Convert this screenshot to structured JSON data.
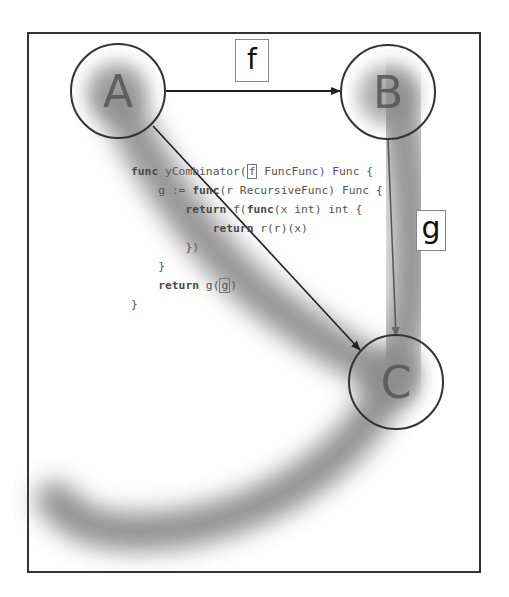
{
  "diagram": {
    "type": "directed-graph",
    "nodes": [
      {
        "id": "A",
        "label": "A"
      },
      {
        "id": "B",
        "label": "B"
      },
      {
        "id": "C",
        "label": "C"
      }
    ],
    "edges": [
      {
        "from": "A",
        "to": "B",
        "label": "f"
      },
      {
        "from": "B",
        "to": "C",
        "label": "g"
      },
      {
        "from": "A",
        "to": "C",
        "label": ""
      }
    ],
    "edge_labels": {
      "f": "f",
      "g": "g"
    },
    "code": {
      "lines": [
        {
          "indent": "",
          "parts": [
            {
              "text": "func",
              "kw": true
            },
            {
              "text": " yCombinator(",
              "kw": false
            },
            {
              "text": "f",
              "box": true
            },
            {
              "text": " FuncFunc) Func {",
              "kw": false
            }
          ]
        },
        {
          "indent": "    ",
          "parts": [
            {
              "text": "g := ",
              "kw": false
            },
            {
              "text": "func",
              "kw": true
            },
            {
              "text": "(r RecursiveFunc) Func {",
              "kw": false
            }
          ]
        },
        {
          "indent": "        ",
          "parts": [
            {
              "text": "return",
              "kw": true
            },
            {
              "text": " f(",
              "kw": false
            },
            {
              "text": "func",
              "kw": true
            },
            {
              "text": "(x int) int {",
              "kw": false
            }
          ]
        },
        {
          "indent": "            ",
          "parts": [
            {
              "text": "return",
              "kw": true
            },
            {
              "text": " r(r)(x)",
              "kw": false
            }
          ]
        },
        {
          "indent": "        ",
          "parts": [
            {
              "text": "})",
              "kw": false
            }
          ]
        },
        {
          "indent": "    ",
          "parts": [
            {
              "text": "}",
              "kw": false
            }
          ]
        },
        {
          "indent": "    ",
          "parts": [
            {
              "text": "return",
              "kw": true
            },
            {
              "text": " g(",
              "kw": false
            },
            {
              "text": "g",
              "box": true
            },
            {
              "text": ")",
              "kw": false
            }
          ]
        },
        {
          "indent": "",
          "parts": [
            {
              "text": "}",
              "kw": false
            }
          ]
        }
      ]
    },
    "colors": {
      "frame": "#333333",
      "node_stroke": "#333333",
      "edge": "#222222",
      "highlight_blur": "#777777",
      "code_text": "#555555"
    }
  }
}
